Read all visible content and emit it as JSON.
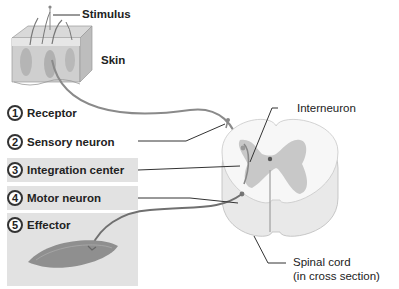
{
  "diagram": {
    "labels": {
      "stimulus": "Stimulus",
      "skin": "Skin",
      "interneuron": "Interneuron",
      "spinal_cord_line1": "Spinal cord",
      "spinal_cord_line2": "(in cross section)"
    },
    "steps": [
      {
        "number": "1",
        "label": "Receptor",
        "shaded": false
      },
      {
        "number": "2",
        "label": "Sensory neuron",
        "shaded": false
      },
      {
        "number": "3",
        "label": "Integration center",
        "shaded": true
      },
      {
        "number": "4",
        "label": "Motor neuron",
        "shaded": true
      },
      {
        "number": "5",
        "label": "Effector",
        "shaded": true
      }
    ],
    "colors": {
      "leader_line": "#333333",
      "nerve": "#777777",
      "gray_matter": "#c8c8c8",
      "white_matter": "#f4f4f4",
      "box_shade": "#e2e2e2"
    }
  }
}
